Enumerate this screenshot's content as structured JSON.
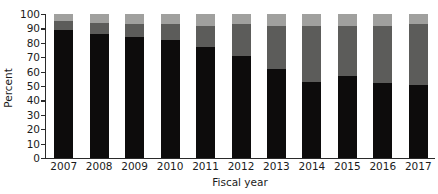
{
  "chart_data": {
    "type": "bar",
    "subtype": "stacked-bar-100",
    "title": "",
    "xlabel": "Fiscal year",
    "ylabel": "Percent",
    "categories": [
      "2007",
      "2008",
      "2009",
      "2010",
      "2011",
      "2012",
      "2013",
      "2014",
      "2015",
      "2016",
      "2017"
    ],
    "ylim": [
      0,
      100
    ],
    "yticks": [
      0,
      10,
      20,
      30,
      40,
      50,
      60,
      70,
      80,
      90,
      100
    ],
    "ytick_labels": [
      "0",
      "10",
      "20",
      "30",
      "40",
      "50",
      "60",
      "70",
      "80",
      "90",
      "100"
    ],
    "grid": false,
    "legend": null,
    "legend_position": "none",
    "series": [
      {
        "name": "lower-segment",
        "color": "#0d0c0c",
        "values": [
          89,
          86,
          84,
          82,
          77,
          71,
          62,
          53,
          57,
          52,
          51
        ]
      },
      {
        "name": "middle-segment",
        "color": "#5c5c5a",
        "values": [
          6,
          8,
          9,
          11,
          15,
          22,
          30,
          39,
          35,
          40,
          42
        ]
      },
      {
        "name": "upper-segment",
        "color": "#a0a09e",
        "values": [
          5,
          6,
          7,
          7,
          8,
          7,
          8,
          8,
          8,
          8,
          7
        ]
      }
    ]
  }
}
